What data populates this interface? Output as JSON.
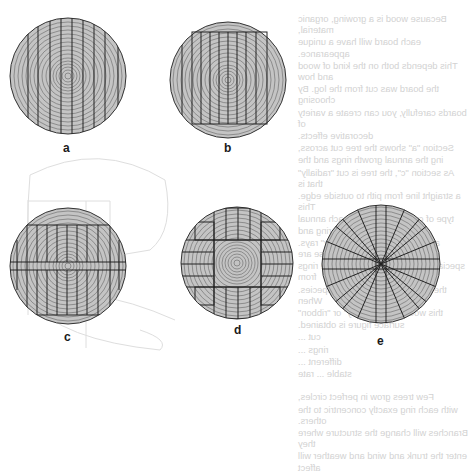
{
  "figure": {
    "diagrams": [
      {
        "id": "a",
        "label": "a",
        "pattern": "plain-sawn (through-and-through parallel cuts)"
      },
      {
        "id": "b",
        "label": "b",
        "pattern": "squared log, parallel cuts"
      },
      {
        "id": "c",
        "label": "c",
        "pattern": "squared with central horizontal band and parallel cuts"
      },
      {
        "id": "d",
        "label": "d",
        "pattern": "boxed heart with boards on four sides"
      },
      {
        "id": "e",
        "label": "e",
        "pattern": "radial / quarter-sawn cuts"
      }
    ],
    "colors": {
      "log_fill": "#c4c4c4",
      "ring_stroke": "#555555",
      "cut_stroke": "#222222",
      "ghost_text": "#d2d2d2",
      "ghost_lines": "#dddddd"
    }
  },
  "bleed_through_text": {
    "mirrored": true,
    "paragraphs": [
      [
        "Because wood is a growing, organic material,",
        "each board will have a unique appearance.",
        "This depends both on the kind of wood and how",
        "the board was cut from the log. By choosing",
        "boards carefully, you can create a variety of",
        "decorative effects."
      ],
      [
        "Section \"a\" shows the tree cut across,",
        "ing the annual growth rings and the",
        "As section \"c\", the tree is cut \"radially\" that is",
        "a straight line from pith to outside edge. This",
        "type of cut slices through each annual ring and",
        "also exposes the \"medullary\" rays. These are",
        "special cells that grow between the rings from",
        "the pith to the bark in many species. When",
        "this wood is cut \"silvery\" or \"ribbon\"",
        "surface figure is obtained.",
        "cut ...",
        "rings ...",
        "different ...",
        "stable ... rate"
      ],
      [
        "Few trees grow in perfect circles,",
        "with each ring exactly concentric to the others.",
        "Branches will change the structure where they",
        "enter the trunk and wind and weather will affect"
      ]
    ]
  }
}
